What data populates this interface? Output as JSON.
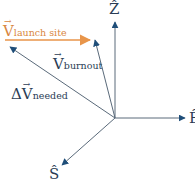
{
  "diagram": {
    "colors": {
      "axis": "#1f4e79",
      "line": "#5a6a7a",
      "launch": "#e8954a",
      "launch_text": "#d9873f",
      "text": "#2b3d55"
    },
    "labels": {
      "launch_main": "V",
      "launch_sub": "launch site",
      "burnout_main": "V",
      "burnout_sub": "burnout",
      "delta_prefix": "Δ",
      "delta_main": "V",
      "delta_sub": "needed",
      "axis_z": "Ẑ",
      "axis_e": "Ê",
      "axis_s": "Ŝ",
      "arrow_glyph": "⃗"
    },
    "vectors": [
      {
        "name": "V launch site",
        "from": [
          5,
          40
        ],
        "to": [
          90,
          40
        ]
      },
      {
        "name": "V burnout",
        "from": [
          115,
          118
        ],
        "to": [
          95,
          40
        ]
      },
      {
        "name": "Delta V needed",
        "from": [
          115,
          118
        ],
        "to": [
          10,
          47
        ]
      },
      {
        "name": "Z axis",
        "from": [
          115,
          118
        ],
        "to": [
          115,
          22
        ]
      },
      {
        "name": "E axis",
        "from": [
          115,
          118
        ],
        "to": [
          185,
          118
        ]
      },
      {
        "name": "S axis",
        "from": [
          115,
          118
        ],
        "to": [
          62,
          165
        ]
      }
    ]
  }
}
